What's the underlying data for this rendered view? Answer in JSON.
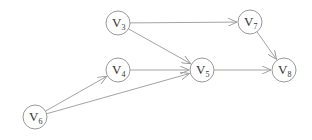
{
  "diagram": {
    "type": "directed-graph",
    "colors": {
      "stroke": "#999999",
      "text": "#333333",
      "background": "#ffffff"
    },
    "nodes": [
      {
        "id": "v3",
        "base": "V",
        "sub": "3",
        "x": 118,
        "y": 23
      },
      {
        "id": "v4",
        "base": "V",
        "sub": "4",
        "x": 118,
        "y": 70
      },
      {
        "id": "v5",
        "base": "V",
        "sub": "5",
        "x": 202,
        "y": 70
      },
      {
        "id": "v6",
        "base": "V",
        "sub": "6",
        "x": 35,
        "y": 117
      },
      {
        "id": "v7",
        "base": "V",
        "sub": "7",
        "x": 250,
        "y": 22
      },
      {
        "id": "v8",
        "base": "V",
        "sub": "8",
        "x": 284,
        "y": 70
      }
    ],
    "edges": [
      {
        "from": "v3",
        "to": "v7"
      },
      {
        "from": "v3",
        "to": "v5"
      },
      {
        "from": "v4",
        "to": "v5"
      },
      {
        "from": "v6",
        "to": "v4"
      },
      {
        "from": "v6",
        "to": "v5"
      },
      {
        "from": "v5",
        "to": "v8"
      },
      {
        "from": "v7",
        "to": "v8"
      }
    ]
  }
}
